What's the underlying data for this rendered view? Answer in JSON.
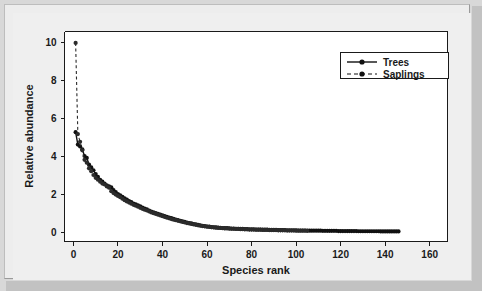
{
  "chart_data": {
    "type": "line",
    "title": "",
    "xlabel": "Species rank",
    "ylabel": "Relative abundance",
    "xlim": [
      -4,
      168
    ],
    "ylim": [
      -0.45,
      10.6
    ],
    "xticks": [
      0,
      20,
      40,
      60,
      80,
      100,
      120,
      140,
      160
    ],
    "xtick_labels": [
      "0",
      "20",
      "40",
      "60",
      "80",
      "100",
      "120",
      "140",
      "160"
    ],
    "yticks": [
      0,
      2,
      4,
      6,
      8,
      10
    ],
    "ytick_labels": [
      "0",
      "2",
      "4",
      "6",
      "8",
      "10"
    ],
    "grid": false,
    "legend_position": "top-right",
    "series": [
      {
        "name": "Trees",
        "line_style": "solid",
        "marker": "filled-circle",
        "color": "#111111",
        "x": [
          1,
          2,
          3,
          4,
          5,
          6,
          7,
          8,
          9,
          10,
          11,
          12,
          13,
          14,
          15,
          16,
          17,
          18,
          19,
          20,
          21,
          22,
          23,
          24,
          25,
          26,
          27,
          28,
          29,
          30,
          31,
          32,
          33,
          34,
          35,
          36,
          37,
          38,
          39,
          40,
          41,
          42,
          43,
          44,
          45,
          46,
          47,
          48,
          49,
          50,
          51,
          52,
          53,
          54,
          55,
          56,
          57,
          58,
          59,
          60,
          61,
          62,
          63,
          64,
          65,
          66,
          67,
          68,
          69,
          70,
          71,
          72,
          73,
          74,
          75,
          76,
          77,
          78,
          79,
          80,
          81,
          82,
          83,
          84,
          85,
          86,
          87,
          88,
          89,
          90,
          91,
          92,
          93,
          94,
          95,
          96,
          97,
          98,
          99,
          100,
          101,
          102,
          103,
          104,
          105,
          106,
          107,
          108,
          109,
          110,
          111,
          112,
          113,
          114,
          115,
          116,
          117,
          118,
          119,
          120,
          121,
          122,
          123,
          124,
          125,
          126,
          127,
          128,
          129,
          130,
          131,
          132,
          133,
          134,
          135,
          136,
          137,
          138,
          139,
          140,
          141,
          142,
          143,
          144,
          145,
          146
        ],
        "y": [
          5.3,
          4.65,
          4.55,
          4.4,
          4.05,
          3.95,
          3.6,
          3.45,
          3.3,
          3.1,
          2.95,
          2.8,
          2.7,
          2.6,
          2.5,
          2.45,
          2.4,
          2.25,
          2.15,
          2.05,
          1.98,
          1.9,
          1.82,
          1.75,
          1.68,
          1.62,
          1.55,
          1.5,
          1.45,
          1.4,
          1.34,
          1.28,
          1.24,
          1.18,
          1.12,
          1.08,
          1.04,
          1.0,
          0.96,
          0.92,
          0.88,
          0.85,
          0.81,
          0.78,
          0.74,
          0.7,
          0.67,
          0.64,
          0.61,
          0.58,
          0.55,
          0.52,
          0.5,
          0.47,
          0.45,
          0.42,
          0.4,
          0.38,
          0.36,
          0.34,
          0.33,
          0.31,
          0.3,
          0.29,
          0.28,
          0.27,
          0.26,
          0.25,
          0.25,
          0.24,
          0.23,
          0.23,
          0.22,
          0.22,
          0.21,
          0.21,
          0.2,
          0.2,
          0.19,
          0.19,
          0.19,
          0.18,
          0.18,
          0.18,
          0.17,
          0.17,
          0.17,
          0.16,
          0.16,
          0.16,
          0.16,
          0.15,
          0.15,
          0.15,
          0.15,
          0.14,
          0.14,
          0.14,
          0.14,
          0.14,
          0.13,
          0.13,
          0.13,
          0.13,
          0.13,
          0.12,
          0.12,
          0.12,
          0.12,
          0.12,
          0.12,
          0.11,
          0.11,
          0.11,
          0.11,
          0.11,
          0.11,
          0.11,
          0.1,
          0.1,
          0.1,
          0.1,
          0.1,
          0.1,
          0.1,
          0.1,
          0.1,
          0.09,
          0.09,
          0.09,
          0.09,
          0.09,
          0.09,
          0.09,
          0.09,
          0.09,
          0.09,
          0.08,
          0.08,
          0.08,
          0.08,
          0.08,
          0.08,
          0.08,
          0.08,
          0.08
        ]
      },
      {
        "name": "Saplings",
        "line_style": "dashed",
        "marker": "filled-circle",
        "color": "#2b2b2b",
        "x": [
          1,
          2,
          3,
          4,
          5,
          6,
          7,
          8,
          9,
          10,
          11,
          12,
          13,
          14,
          15,
          16,
          17,
          18,
          19,
          20,
          21,
          22,
          23,
          24,
          25,
          26,
          27,
          28,
          29,
          30,
          31,
          32,
          33,
          34,
          35,
          36,
          37,
          38,
          39,
          40,
          41,
          42,
          43,
          44,
          45,
          46,
          47,
          48,
          49,
          50,
          51,
          52,
          53,
          54,
          55,
          56,
          57,
          58,
          59,
          60,
          61,
          62,
          63,
          64,
          65,
          66,
          67,
          68,
          69,
          70,
          71,
          72,
          73,
          74,
          75,
          76,
          77,
          78,
          79,
          80,
          81,
          82,
          83,
          84,
          85,
          86,
          87,
          88,
          89,
          90,
          91,
          92,
          93,
          94,
          95,
          96,
          97,
          98,
          99,
          100,
          101,
          102,
          103,
          104,
          105
        ],
        "y": [
          10.0,
          5.2,
          4.8,
          4.35,
          3.85,
          3.7,
          3.4,
          3.25,
          3.05,
          2.9,
          2.8,
          2.7,
          2.6,
          2.55,
          2.45,
          2.38,
          2.2,
          2.1,
          2.02,
          1.95,
          1.88,
          1.8,
          1.72,
          1.66,
          1.6,
          1.54,
          1.48,
          1.43,
          1.38,
          1.32,
          1.27,
          1.22,
          1.18,
          1.13,
          1.08,
          1.04,
          1.0,
          0.96,
          0.92,
          0.88,
          0.84,
          0.8,
          0.77,
          0.73,
          0.7,
          0.67,
          0.64,
          0.61,
          0.58,
          0.55,
          0.52,
          0.5,
          0.47,
          0.45,
          0.43,
          0.4,
          0.38,
          0.36,
          0.35,
          0.33,
          0.32,
          0.3,
          0.29,
          0.28,
          0.27,
          0.26,
          0.25,
          0.24,
          0.24,
          0.23,
          0.22,
          0.22,
          0.21,
          0.21,
          0.2,
          0.2,
          0.19,
          0.19,
          0.18,
          0.18,
          0.18,
          0.17,
          0.17,
          0.17,
          0.16,
          0.16,
          0.16,
          0.15,
          0.15,
          0.15,
          0.15,
          0.14,
          0.14,
          0.14,
          0.14,
          0.13,
          0.13,
          0.13,
          0.13,
          0.12,
          0.12,
          0.12,
          0.12,
          0.12,
          0.11
        ]
      }
    ],
    "legend": [
      {
        "label": "Trees",
        "line_style": "solid",
        "marker": "filled-circle"
      },
      {
        "label": "Saplings",
        "line_style": "dashed",
        "marker": "filled-circle"
      }
    ]
  },
  "colors": {
    "figure_background": "#d8d8d8",
    "panel_background": "#ffffff",
    "axis": "#1a1a1a",
    "series_trees": "#111111",
    "series_saplings": "#2b2b2b"
  }
}
